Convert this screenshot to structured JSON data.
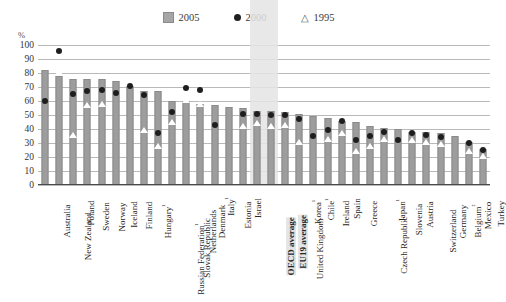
{
  "axis": {
    "unit_label": "%",
    "yticks": [
      0,
      10,
      20,
      30,
      40,
      50,
      60,
      70,
      80,
      90,
      100
    ],
    "ylim": [
      0,
      100
    ]
  },
  "legend": {
    "items": [
      {
        "label": "2005",
        "marker": "square",
        "color": "#a6a6a6"
      },
      {
        "label": "2000",
        "marker": "circle",
        "color": "#221f1f"
      },
      {
        "label": "1995",
        "marker": "triangle",
        "color": "#5a5a5a"
      }
    ]
  },
  "highlight": {
    "categories": [
      "OECD average",
      "EU19 average"
    ],
    "color": "#e4e4e4"
  },
  "chart_data": {
    "type": "bar",
    "title": "",
    "xlabel": "",
    "ylabel": "%",
    "ylim": [
      0,
      100
    ],
    "grid": true,
    "legend_position": "top-center",
    "categories": [
      "Australia",
      "New Zealand",
      "Poland",
      "Sweden",
      "Norway",
      "Iceland",
      "Finland",
      "Hungary¹",
      "Russian Federation¹",
      "Slovak Republic",
      "Netherlands",
      "Denmark",
      "Italy¹",
      "Estonia",
      "Israel",
      "OECD average",
      "EU19 average",
      "United Kingdom",
      "Korea¹",
      "Chile¹",
      "Ireland",
      "Spain",
      "Greece",
      "Czech Republic",
      "Japan¹",
      "Slovenia",
      "Austria",
      "Switzerland",
      "Germany",
      "Belgium²",
      "Mexico",
      "Turkey"
    ],
    "series": [
      {
        "name": "2005",
        "marker": "bar",
        "values": [
          82,
          78,
          76,
          76,
          76,
          74,
          71,
          67,
          67,
          60,
          60,
          58,
          57,
          56,
          55,
          53,
          53,
          52,
          51,
          49,
          48,
          46,
          45,
          42,
          41,
          40,
          38,
          38,
          37,
          35,
          31,
          26
        ]
      },
      {
        "name": "2000",
        "marker": "circle",
        "values": [
          60,
          96,
          65,
          67,
          68,
          66,
          71,
          64,
          37,
          52,
          69,
          68,
          43,
          null,
          51,
          51,
          50,
          50,
          47,
          35,
          39,
          46,
          32,
          35,
          38,
          32,
          37,
          36,
          34,
          null,
          30,
          25
        ]
      },
      {
        "name": "1995",
        "marker": "triangle",
        "values": [
          null,
          81,
          36,
          57,
          58,
          null,
          null,
          39,
          28,
          45,
          61,
          58,
          null,
          null,
          42,
          44,
          42,
          43,
          31,
          null,
          33,
          37,
          24,
          28,
          33,
          null,
          32,
          31,
          29,
          null,
          24,
          21
        ]
      }
    ]
  }
}
